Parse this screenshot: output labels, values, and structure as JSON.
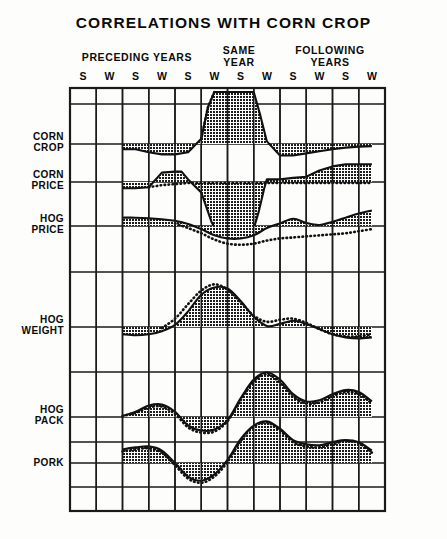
{
  "chart_data": {
    "type": "area",
    "title": "CORRELATIONS WITH CORN CROP",
    "xlabel": "",
    "ylabel": "",
    "grid": true,
    "legend_position": "none",
    "group_headers": [
      {
        "id": "preceding",
        "label": "PRECEDING YEARS"
      },
      {
        "id": "same",
        "label": "SAME\nYEAR"
      },
      {
        "id": "following",
        "label": "FOLLOWING\nYEARS"
      }
    ],
    "group_headers_text": {
      "preceding": "PRECEDING YEARS",
      "same_line1": "SAME",
      "same_line2": "YEAR",
      "following_line1": "FOLLOWING",
      "following_line2": "YEARS"
    },
    "x_tick_labels": [
      "S",
      "W",
      "S",
      "W",
      "S",
      "W",
      "S",
      "W",
      "S",
      "W",
      "S",
      "W"
    ],
    "categories": [
      "S",
      "W",
      "S",
      "W",
      "S",
      "W",
      "S",
      "W",
      "S",
      "W",
      "S",
      "W"
    ],
    "series": [
      {
        "name": "CORN CROP",
        "row_label_line1": "CORN",
        "row_label_line2": "CROP",
        "style": "shaded-solid",
        "x": [
          2.0,
          2.5,
          3.0,
          3.5,
          4.0,
          4.5,
          5.0,
          5.25,
          5.5,
          6.0,
          6.5,
          7.0,
          7.25,
          7.5,
          8.0,
          8.5,
          9.0,
          9.5,
          10.0,
          10.5,
          11.0,
          11.5
        ],
        "values": [
          -0.1,
          -0.1,
          -0.16,
          -0.2,
          -0.2,
          -0.16,
          0.1,
          0.7,
          1.0,
          1.0,
          1.0,
          1.0,
          0.55,
          0.05,
          -0.22,
          -0.22,
          -0.18,
          -0.14,
          -0.1,
          -0.07,
          -0.05,
          -0.04
        ],
        "dotted_x": [
          5.0,
          5.25,
          5.5
        ],
        "dotted_values": [
          0.1,
          0.7,
          1.0
        ]
      },
      {
        "name": "CORN PRICE",
        "row_label_line1": "CORN",
        "row_label_line2": "PRICE",
        "style": "shaded-solid-with-dotted",
        "x": [
          2.0,
          2.5,
          3.0,
          3.5,
          4.0,
          4.25,
          4.5,
          5.0,
          5.4,
          5.6,
          6.0,
          6.5,
          7.0,
          7.2,
          7.4,
          7.5,
          8.0,
          8.5,
          9.0,
          9.5,
          10.0,
          10.5,
          11.0,
          11.5
        ],
        "values": [
          -0.12,
          -0.12,
          -0.1,
          0.18,
          0.2,
          0.2,
          0.05,
          -0.2,
          -0.78,
          -0.95,
          -0.95,
          -0.95,
          -0.9,
          -0.55,
          -0.12,
          0.05,
          0.05,
          0.08,
          0.1,
          0.22,
          0.3,
          0.34,
          0.34,
          0.34
        ],
        "dotted_x": [
          3.0,
          3.5,
          4.0,
          4.5,
          5.0,
          5.5,
          6.0,
          6.5,
          7.0,
          7.5,
          8.0,
          8.5,
          9.0,
          9.5,
          10.0,
          10.5,
          11.0,
          11.5
        ],
        "dotted_values": [
          -0.1,
          -0.06,
          -0.04,
          -0.02,
          -0.02,
          -0.02,
          -0.02,
          -0.02,
          -0.02,
          -0.02,
          -0.02,
          -0.02,
          -0.02,
          -0.02,
          -0.02,
          -0.02,
          -0.02,
          -0.02
        ]
      },
      {
        "name": "HOG PRICE",
        "row_label_line1": "HOG",
        "row_label_line2": "PRICE",
        "style": "shaded-solid-with-dotted",
        "x": [
          2.0,
          2.5,
          3.0,
          3.5,
          4.0,
          4.5,
          5.0,
          5.5,
          6.0,
          6.5,
          7.0,
          7.5,
          8.0,
          8.5,
          9.0,
          9.5,
          10.0,
          10.5,
          11.0,
          11.5
        ],
        "values": [
          0.16,
          0.16,
          0.15,
          0.13,
          0.1,
          0.04,
          -0.06,
          -0.18,
          -0.24,
          -0.24,
          -0.18,
          -0.04,
          0.05,
          0.14,
          0.06,
          0.02,
          0.08,
          0.16,
          0.24,
          0.3
        ],
        "dotted_x": [
          4.0,
          4.5,
          5.0,
          5.5,
          6.0,
          6.5,
          7.0,
          7.5,
          8.0,
          8.5,
          9.0,
          9.5,
          10.0,
          10.5,
          11.0,
          11.5
        ],
        "dotted_values": [
          0.05,
          -0.04,
          -0.14,
          -0.26,
          -0.34,
          -0.36,
          -0.34,
          -0.28,
          -0.24,
          -0.22,
          -0.2,
          -0.18,
          -0.16,
          -0.14,
          -0.1,
          -0.06
        ]
      },
      {
        "name": "HOG WEIGHT",
        "row_label_line1": "HOG",
        "row_label_line2": "WEIGHT",
        "style": "shaded-solid-with-dotted",
        "x": [
          2.0,
          2.5,
          3.0,
          3.5,
          4.0,
          4.5,
          5.0,
          5.5,
          6.0,
          6.5,
          7.0,
          7.5,
          8.0,
          8.5,
          9.0,
          9.5,
          10.0,
          10.5,
          11.0,
          11.5
        ],
        "values": [
          -0.14,
          -0.16,
          -0.14,
          -0.08,
          0.04,
          0.3,
          0.62,
          0.76,
          0.74,
          0.5,
          0.2,
          0.02,
          0.06,
          0.12,
          0.06,
          -0.04,
          -0.14,
          -0.2,
          -0.22,
          -0.2
        ],
        "dotted_x": [
          3.5,
          4.0,
          4.5,
          5.0,
          5.5,
          6.0,
          6.5,
          7.0,
          7.5,
          8.0,
          8.5,
          9.0,
          9.5,
          10.0,
          10.5,
          11.0,
          11.5
        ],
        "dotted_values": [
          -0.02,
          0.16,
          0.44,
          0.7,
          0.82,
          0.72,
          0.48,
          0.22,
          0.1,
          0.14,
          0.16,
          0.08,
          -0.04,
          -0.14,
          -0.18,
          -0.18,
          -0.14
        ]
      },
      {
        "name": "HOG PACK",
        "row_label_line1": "HOG",
        "row_label_line2": "PACK",
        "style": "shaded-solid-with-dotted",
        "x": [
          2.0,
          2.5,
          3.0,
          3.5,
          4.0,
          4.5,
          5.0,
          5.5,
          6.0,
          6.5,
          7.0,
          7.5,
          8.0,
          8.5,
          9.0,
          9.5,
          10.0,
          10.5,
          11.0,
          11.5
        ],
        "values": [
          0.02,
          0.1,
          0.22,
          0.24,
          0.1,
          -0.16,
          -0.26,
          -0.24,
          -0.06,
          0.36,
          0.72,
          0.86,
          0.72,
          0.44,
          0.3,
          0.32,
          0.44,
          0.52,
          0.48,
          0.3
        ],
        "dotted_x": [
          2.0,
          2.5,
          3.0,
          3.5,
          4.0,
          4.5,
          5.0,
          5.5,
          6.0,
          6.5,
          7.0,
          7.5,
          8.0,
          8.5,
          9.0,
          9.5,
          10.0,
          10.5,
          11.0,
          11.5
        ],
        "dotted_values": [
          0.02,
          0.08,
          0.18,
          0.2,
          0.06,
          -0.2,
          -0.3,
          -0.28,
          -0.08,
          0.32,
          0.68,
          0.82,
          0.66,
          0.38,
          0.26,
          0.28,
          0.4,
          0.48,
          0.44,
          0.26
        ]
      },
      {
        "name": "PORK",
        "row_label_line1": "PORK",
        "row_label_line2": "",
        "style": "shaded-solid-with-dotted",
        "x": [
          2.0,
          2.5,
          3.0,
          3.5,
          4.0,
          4.5,
          5.0,
          5.5,
          6.0,
          6.5,
          7.0,
          7.5,
          8.0,
          8.5,
          9.0,
          9.5,
          10.0,
          10.5,
          11.0,
          11.5
        ],
        "values": [
          0.26,
          0.3,
          0.32,
          0.24,
          0.0,
          -0.26,
          -0.34,
          -0.22,
          0.06,
          0.46,
          0.72,
          0.8,
          0.66,
          0.44,
          0.36,
          0.34,
          0.4,
          0.44,
          0.4,
          0.24
        ],
        "dotted_x": [
          2.0,
          2.5,
          3.0,
          3.5,
          4.0,
          4.5,
          5.0,
          5.5,
          6.0,
          6.5,
          7.0,
          7.5,
          8.0,
          8.5,
          9.0,
          9.5,
          10.0,
          10.5,
          11.0,
          11.5
        ],
        "dotted_values": [
          0.22,
          0.26,
          0.28,
          0.2,
          -0.04,
          -0.3,
          -0.38,
          -0.26,
          0.02,
          0.42,
          0.7,
          0.78,
          0.62,
          0.4,
          0.32,
          0.3,
          0.36,
          0.42,
          0.38,
          0.2
        ]
      }
    ],
    "axis": {
      "plot_left": 70,
      "plot_right": 385,
      "plot_top": 88,
      "plot_bottom": 511,
      "columns": 12,
      "row_baselines": [
        144,
        182,
        226,
        327,
        417,
        463
      ],
      "extra_gridlines": [
        104,
        272,
        372,
        442,
        487
      ]
    },
    "colors": {
      "ink": "#111111",
      "fill": "#2a2a2a",
      "background": "#fdfdfb",
      "grid": "#1a1a1a"
    }
  }
}
